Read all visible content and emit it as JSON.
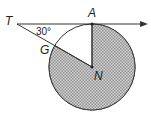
{
  "diagram": {
    "labels": {
      "T": "T",
      "A": "A",
      "G": "G",
      "N": "N",
      "angle": "30°"
    },
    "colors": {
      "stroke": "#333333",
      "shade": "#bdbdbd",
      "background": "#ffffff"
    }
  }
}
